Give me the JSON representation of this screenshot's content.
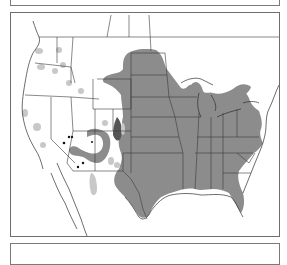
{
  "figure": {
    "type": "species-range-map",
    "region": "North America (contiguous United States, southern Canada, northern Mexico)",
    "colors": {
      "background": "#ffffff",
      "frame": "#6e6e6e",
      "borders": "#3a3a3a",
      "primary_range": "#8c8c8c",
      "peripheral_patches": "#c8c8c8",
      "dense_cluster": "#555555",
      "point_records": "#111111"
    },
    "layers": [
      {
        "name": "primary-range",
        "description": "Continuous range across central and eastern US and southern Canada"
      },
      {
        "name": "peripheral-patches",
        "description": "Scattered light-gray isolated populations in the western US"
      },
      {
        "name": "southwest-arc",
        "description": "Arc-shaped range across Arizona and New Mexico"
      },
      {
        "name": "point-records",
        "description": "Isolated black occurrence dots in Arizona"
      }
    ]
  }
}
